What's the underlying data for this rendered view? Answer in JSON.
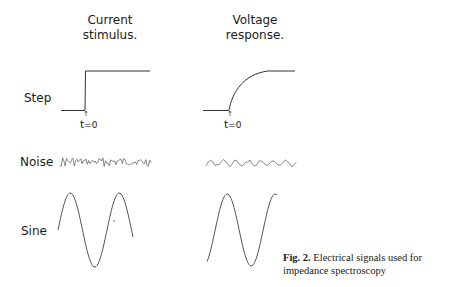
{
  "figure": {
    "columns": [
      {
        "title_line1": "Current",
        "title_line2": "stimulus."
      },
      {
        "title_line1": "Voltage",
        "title_line2": "response."
      }
    ],
    "rows": [
      {
        "label": "Step"
      },
      {
        "label": "Noise"
      },
      {
        "label": "Sine"
      }
    ],
    "time_marker": {
      "arrow": "↑",
      "t": "t",
      "eq": "=0"
    },
    "caption": {
      "number": "Fig. 2.",
      "text": "Electrical signals used for impedance spectroscopy"
    }
  }
}
